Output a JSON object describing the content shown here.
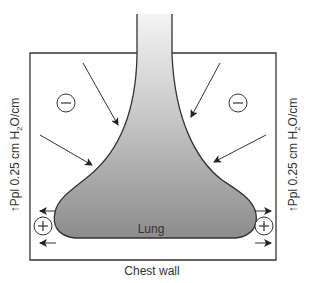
{
  "diagram": {
    "lung_label": "Lung",
    "chest_wall_label": "Chest wall",
    "left_side_label": {
      "arrow": "↑",
      "prefix": "Ppl 0.25 cm H",
      "subscript": "2",
      "suffix": "O/cm"
    },
    "right_side_label": {
      "arrow": "↑",
      "prefix": "Ppl 0.25 cm H",
      "subscript": "2",
      "suffix": "O/cm"
    },
    "upper_left_sign": "−",
    "upper_right_sign": "−",
    "lower_left_sign": "+",
    "lower_right_sign": "+",
    "colors": {
      "line": "#333333",
      "lung_fill_dark": "#8a8a8a",
      "lung_fill_light": "#f2f2f2"
    }
  }
}
